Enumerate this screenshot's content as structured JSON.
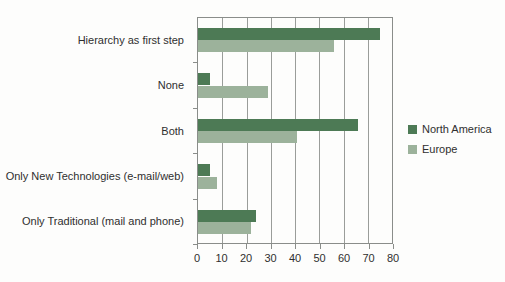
{
  "chart_data": {
    "type": "bar",
    "orientation": "horizontal",
    "title": "",
    "xlabel": "",
    "ylabel": "",
    "categories": [
      "Hierarchy as first step",
      "None",
      "Both",
      "Only New Technologies (e-mail/web)",
      "Only Traditional (mail and phone)"
    ],
    "series": [
      {
        "name": "North America",
        "color": "#4d7a55",
        "values": [
          75,
          5,
          66,
          5,
          24
        ]
      },
      {
        "name": "Europe",
        "color": "#9cb29b",
        "values": [
          56,
          29,
          41,
          8,
          22
        ]
      }
    ],
    "xlim": [
      0,
      80
    ],
    "ticks": [
      0,
      10,
      20,
      30,
      40,
      50,
      60,
      70,
      80
    ],
    "grid": true,
    "legend_position": "right",
    "frame_color": "#8a8d8a",
    "gridline_color": "#9a9d9a"
  }
}
